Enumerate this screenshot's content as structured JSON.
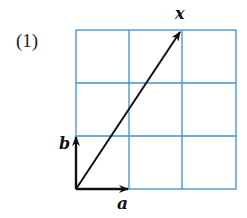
{
  "problem_number": "(1)",
  "grid": {
    "cols": 3,
    "rows": 3,
    "color": "#3d8fd6"
  },
  "vectors": [
    {
      "name": "a",
      "label": "a",
      "dx": 1,
      "dy": 0
    },
    {
      "name": "b",
      "label": "b",
      "dx": 0,
      "dy": 1
    },
    {
      "name": "x",
      "label": "x",
      "dx": 2,
      "dy": 3
    }
  ]
}
